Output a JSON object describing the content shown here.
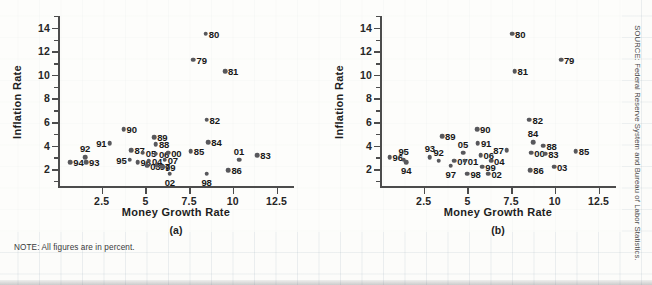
{
  "figure": {
    "note": "NOTE: All figures are in percent.",
    "source": "SOURCE: Federal Reserve System and Bureau of Labor Statistics.",
    "point_color": "#58585c",
    "axis_color": "#4c4c4c"
  },
  "chart_data": [
    {
      "type": "scatter",
      "title": "",
      "caption": "(a)",
      "xlabel": "Money Growth Rate",
      "ylabel": "Inflation Rate",
      "xlim": [
        0,
        13.5
      ],
      "ylim": [
        0.4,
        15.0
      ],
      "xticks": [
        2.5,
        5,
        7.5,
        10,
        12.5
      ],
      "yticks": [
        2,
        4,
        6,
        8,
        10,
        12,
        14
      ],
      "yminorticks": [
        1,
        3,
        5,
        7,
        9,
        11,
        13,
        15
      ],
      "grid": false,
      "legend": "none",
      "points": [
        {
          "label": "94",
          "x": 0.7,
          "y": 2.6,
          "pos": "right"
        },
        {
          "label": "93",
          "x": 1.6,
          "y": 2.6,
          "pos": "right"
        },
        {
          "label": "92",
          "x": 1.55,
          "y": 3.0,
          "pos": "top"
        },
        {
          "label": "91",
          "x": 2.95,
          "y": 4.2,
          "pos": "left"
        },
        {
          "label": "90",
          "x": 3.75,
          "y": 5.4,
          "pos": "right"
        },
        {
          "label": "95",
          "x": 4.1,
          "y": 2.8,
          "pos": "left"
        },
        {
          "label": "87",
          "x": 4.2,
          "y": 3.6,
          "pos": "right"
        },
        {
          "label": "96",
          "x": 4.55,
          "y": 2.6,
          "pos": "right"
        },
        {
          "label": "05",
          "x": 4.85,
          "y": 3.4,
          "pos": "right"
        },
        {
          "label": "04",
          "x": 5.2,
          "y": 2.7,
          "pos": "right"
        },
        {
          "label": "03",
          "x": 5.1,
          "y": 2.3,
          "pos": "right"
        },
        {
          "label": "89",
          "x": 5.5,
          "y": 4.7,
          "pos": "right"
        },
        {
          "label": "88",
          "x": 5.6,
          "y": 4.1,
          "pos": "right"
        },
        {
          "label": "06",
          "x": 5.6,
          "y": 3.3,
          "pos": "right"
        },
        {
          "label": "97",
          "x": 5.65,
          "y": 2.3,
          "pos": "right"
        },
        {
          "label": "99",
          "x": 5.95,
          "y": 2.2,
          "pos": "right"
        },
        {
          "label": "07",
          "x": 6.1,
          "y": 2.8,
          "pos": "right"
        },
        {
          "label": "00",
          "x": 6.3,
          "y": 3.4,
          "pos": "right"
        },
        {
          "label": "02",
          "x": 6.4,
          "y": 1.6,
          "pos": "bottom"
        },
        {
          "label": "85",
          "x": 7.6,
          "y": 3.5,
          "pos": "right"
        },
        {
          "label": "98",
          "x": 8.5,
          "y": 1.6,
          "pos": "bottom"
        },
        {
          "label": "84",
          "x": 8.6,
          "y": 4.3,
          "pos": "right"
        },
        {
          "label": "82",
          "x": 8.5,
          "y": 6.2,
          "pos": "right"
        },
        {
          "label": "80",
          "x": 8.45,
          "y": 13.5,
          "pos": "right"
        },
        {
          "label": "79",
          "x": 7.75,
          "y": 11.3,
          "pos": "right"
        },
        {
          "label": "81",
          "x": 9.55,
          "y": 10.3,
          "pos": "right"
        },
        {
          "label": "86",
          "x": 9.75,
          "y": 1.9,
          "pos": "right"
        },
        {
          "label": "01",
          "x": 10.35,
          "y": 2.8,
          "pos": "top"
        },
        {
          "label": "83",
          "x": 11.4,
          "y": 3.2,
          "pos": "right"
        }
      ]
    },
    {
      "type": "scatter",
      "title": "",
      "caption": "(b)",
      "xlabel": "Money Growth Rate",
      "ylabel": "Inflation Rate",
      "xlim": [
        0,
        13.5
      ],
      "ylim": [
        0.4,
        15.0
      ],
      "xticks": [
        2.5,
        5,
        7.5,
        10,
        12.5
      ],
      "yticks": [
        2,
        4,
        6,
        8,
        10,
        12,
        14
      ],
      "yminorticks": [
        1,
        3,
        5,
        7,
        9,
        11,
        13,
        15
      ],
      "grid": false,
      "legend": "none",
      "points": [
        {
          "label": "96",
          "x": 0.55,
          "y": 3.0,
          "pos": "right"
        },
        {
          "label": "95",
          "x": 1.35,
          "y": 2.8,
          "pos": "top"
        },
        {
          "label": "94",
          "x": 1.5,
          "y": 2.6,
          "pos": "bottom"
        },
        {
          "label": "93",
          "x": 2.85,
          "y": 3.0,
          "pos": "top"
        },
        {
          "label": "92",
          "x": 3.35,
          "y": 2.7,
          "pos": "top"
        },
        {
          "label": "89",
          "x": 3.55,
          "y": 4.8,
          "pos": "right"
        },
        {
          "label": "97",
          "x": 4.05,
          "y": 2.3,
          "pos": "bottom"
        },
        {
          "label": "07",
          "x": 4.25,
          "y": 2.7,
          "pos": "right"
        },
        {
          "label": "05",
          "x": 4.75,
          "y": 3.4,
          "pos": "top"
        },
        {
          "label": "01",
          "x": 4.85,
          "y": 2.7,
          "pos": "right"
        },
        {
          "label": "98",
          "x": 5.0,
          "y": 1.6,
          "pos": "right"
        },
        {
          "label": "90",
          "x": 5.55,
          "y": 5.4,
          "pos": "right"
        },
        {
          "label": "91",
          "x": 5.6,
          "y": 4.2,
          "pos": "right"
        },
        {
          "label": "06",
          "x": 5.75,
          "y": 3.2,
          "pos": "right"
        },
        {
          "label": "99",
          "x": 5.85,
          "y": 2.2,
          "pos": "right"
        },
        {
          "label": "02",
          "x": 6.2,
          "y": 1.6,
          "pos": "right"
        },
        {
          "label": "04",
          "x": 6.35,
          "y": 2.7,
          "pos": "right"
        },
        {
          "label": "87",
          "x": 7.25,
          "y": 3.6,
          "pos": "left"
        },
        {
          "label": "80",
          "x": 7.55,
          "y": 13.5,
          "pos": "right"
        },
        {
          "label": "81",
          "x": 7.7,
          "y": 10.3,
          "pos": "right"
        },
        {
          "label": "82",
          "x": 8.55,
          "y": 6.2,
          "pos": "right"
        },
        {
          "label": "84",
          "x": 8.75,
          "y": 4.3,
          "pos": "top"
        },
        {
          "label": "00",
          "x": 8.65,
          "y": 3.4,
          "pos": "right"
        },
        {
          "label": "86",
          "x": 8.6,
          "y": 1.9,
          "pos": "right"
        },
        {
          "label": "88",
          "x": 9.35,
          "y": 4.0,
          "pos": "right"
        },
        {
          "label": "83",
          "x": 9.45,
          "y": 3.3,
          "pos": "right"
        },
        {
          "label": "03",
          "x": 9.95,
          "y": 2.2,
          "pos": "right"
        },
        {
          "label": "79",
          "x": 10.35,
          "y": 11.3,
          "pos": "right"
        },
        {
          "label": "85",
          "x": 11.2,
          "y": 3.5,
          "pos": "right"
        }
      ]
    }
  ]
}
